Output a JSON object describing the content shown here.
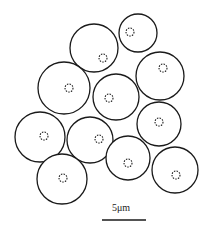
{
  "figure": {
    "cells": [
      {
        "cx": 94,
        "cy": 48,
        "r": 24,
        "nx": 103,
        "ny": 58
      },
      {
        "cx": 138,
        "cy": 33,
        "r": 19,
        "nx": 130,
        "ny": 32
      },
      {
        "cx": 160,
        "cy": 76,
        "r": 24,
        "nx": 163,
        "ny": 68
      },
      {
        "cx": 64,
        "cy": 88,
        "r": 26,
        "nx": 69,
        "ny": 88
      },
      {
        "cx": 116,
        "cy": 97,
        "r": 23,
        "nx": 109,
        "ny": 98
      },
      {
        "cx": 159,
        "cy": 124,
        "r": 22,
        "nx": 159,
        "ny": 122
      },
      {
        "cx": 40,
        "cy": 137,
        "r": 25,
        "nx": 44,
        "ny": 136
      },
      {
        "cx": 90,
        "cy": 140,
        "r": 23,
        "nx": 99,
        "ny": 139
      },
      {
        "cx": 128,
        "cy": 158,
        "r": 22,
        "nx": 128,
        "ny": 163
      },
      {
        "cx": 175,
        "cy": 170,
        "r": 23,
        "nx": 176,
        "ny": 175
      },
      {
        "cx": 62,
        "cy": 179,
        "r": 25,
        "nx": 63,
        "ny": 178
      }
    ],
    "scale_bar": {
      "label": "5μm",
      "x1": 102,
      "x2": 146,
      "y": 220
    }
  }
}
